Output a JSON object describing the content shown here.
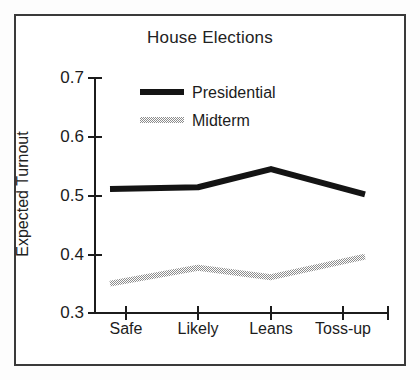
{
  "figure": {
    "frame_color": "#3a3a3a",
    "background": "#ffffff"
  },
  "chart_data": {
    "type": "line",
    "title": "House Elections",
    "xlabel": "",
    "ylabel": "Expected Turnout",
    "categories": [
      "Safe",
      "Likely",
      "Leans",
      "Toss-up"
    ],
    "ylim": [
      0.3,
      0.7
    ],
    "yticks": [
      "0.3",
      "0.4",
      "0.5",
      "0.6",
      "0.7"
    ],
    "ytick_values": [
      0.3,
      0.4,
      0.5,
      0.6,
      0.7
    ],
    "grid": false,
    "legend_position": "upper-left-inside",
    "series": [
      {
        "name": "Presidential",
        "color": "#141414",
        "style": "solid",
        "values": [
          0.511,
          0.514,
          0.545,
          0.502
        ]
      },
      {
        "name": "Midterm",
        "color": "#9a9a9a",
        "style": "dithered",
        "values": [
          0.35,
          0.377,
          0.361,
          0.396
        ]
      }
    ]
  }
}
